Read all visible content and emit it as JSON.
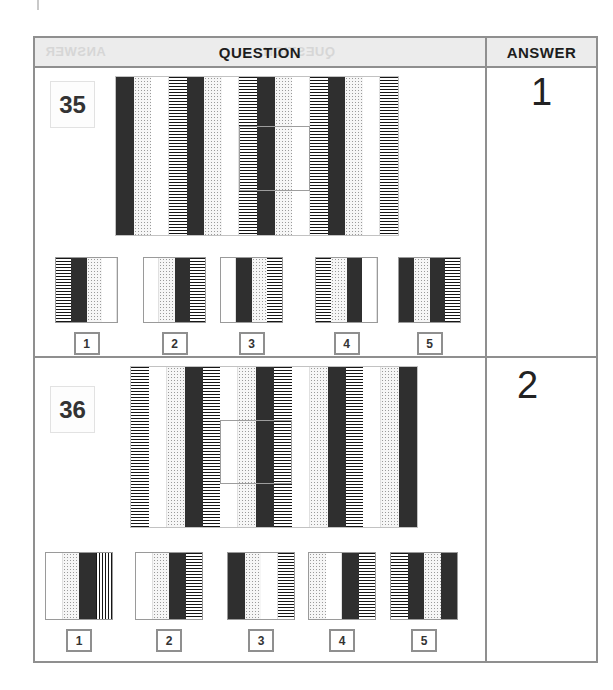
{
  "header": {
    "question_label": "QUESTION",
    "answer_label": "ANSWER",
    "ghost_answer_label": "ANSWER",
    "ghost_question_label": "QUESTION",
    "bg_color": "#ececec"
  },
  "colors": {
    "dark_stripe": "#2f2f2f",
    "table_border": "#8f8f8f",
    "paper": "#ffffff"
  },
  "texture_legend": {
    "dark": "solid dark stripe",
    "dotted": "light gray halftone-dot stripe",
    "white": "plain white stripe",
    "hatch-h": "horizontal-line hatched stripe",
    "hatch-v": "vertical-line hatched stripe"
  },
  "questions": [
    {
      "number": "35",
      "answer": "1",
      "pattern_unit": [
        "dark",
        "dotted",
        "white",
        "hatch-h"
      ],
      "repeats": 4,
      "cutout": {
        "start_stripe": 8,
        "stripe_span": 4
      },
      "options": [
        {
          "label": "1",
          "stripes": [
            "hatch-h",
            "dark",
            "dotted",
            "white"
          ]
        },
        {
          "label": "2",
          "stripes": [
            "white",
            "dotted",
            "dark",
            "hatch-h"
          ]
        },
        {
          "label": "3",
          "stripes": [
            "white",
            "dark",
            "dotted",
            "hatch-h"
          ]
        },
        {
          "label": "4",
          "stripes": [
            "hatch-h",
            "dotted",
            "dark",
            "white"
          ]
        },
        {
          "label": "5",
          "stripes": [
            "dark",
            "dotted",
            "dark",
            "hatch-h"
          ]
        }
      ]
    },
    {
      "number": "36",
      "answer": "2",
      "pattern_unit": [
        "hatch-h",
        "white",
        "dotted",
        "dark"
      ],
      "repeats": 4,
      "cutout": {
        "start_stripe": 6,
        "stripe_span": 4
      },
      "options": [
        {
          "label": "1",
          "stripes": [
            "white",
            "dotted",
            "dark",
            "hatch-v"
          ]
        },
        {
          "label": "2",
          "stripes": [
            "white",
            "dotted",
            "dark",
            "hatch-h"
          ]
        },
        {
          "label": "3",
          "stripes": [
            "dark",
            "dotted",
            "white",
            "hatch-h"
          ]
        },
        {
          "label": "4",
          "stripes": [
            "dotted",
            "white",
            "dark",
            "hatch-h"
          ]
        },
        {
          "label": "5",
          "stripes": [
            "hatch-h",
            "dark",
            "dotted",
            "dark"
          ]
        }
      ]
    }
  ]
}
